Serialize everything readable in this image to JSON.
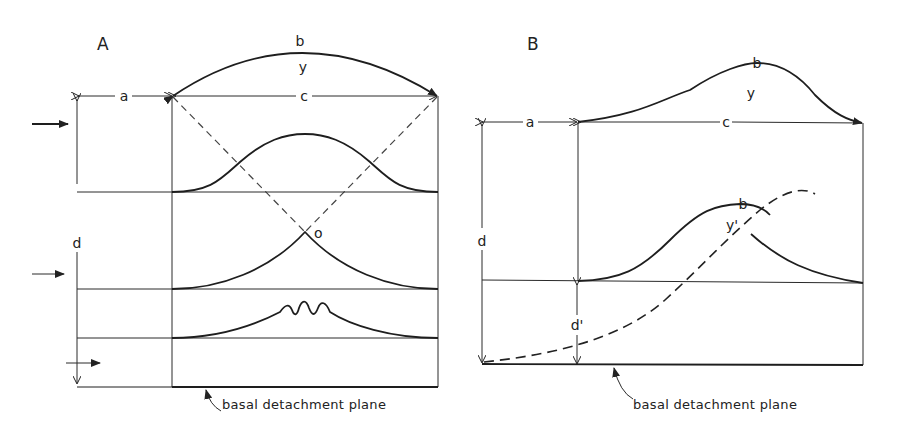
{
  "figure": {
    "panel_a": {
      "title": "A",
      "labels": {
        "a": "a",
        "b": "b",
        "y": "y",
        "c": "c",
        "d": "d",
        "o": "o"
      },
      "caption": "basal detachment plane"
    },
    "panel_b": {
      "title": "B",
      "labels": {
        "a": "a",
        "b": "b",
        "y": "y",
        "c": "c",
        "d": "d",
        "b2": "b",
        "y2": "y'",
        "d2": "d'"
      },
      "caption": "basal detachment plane"
    }
  }
}
